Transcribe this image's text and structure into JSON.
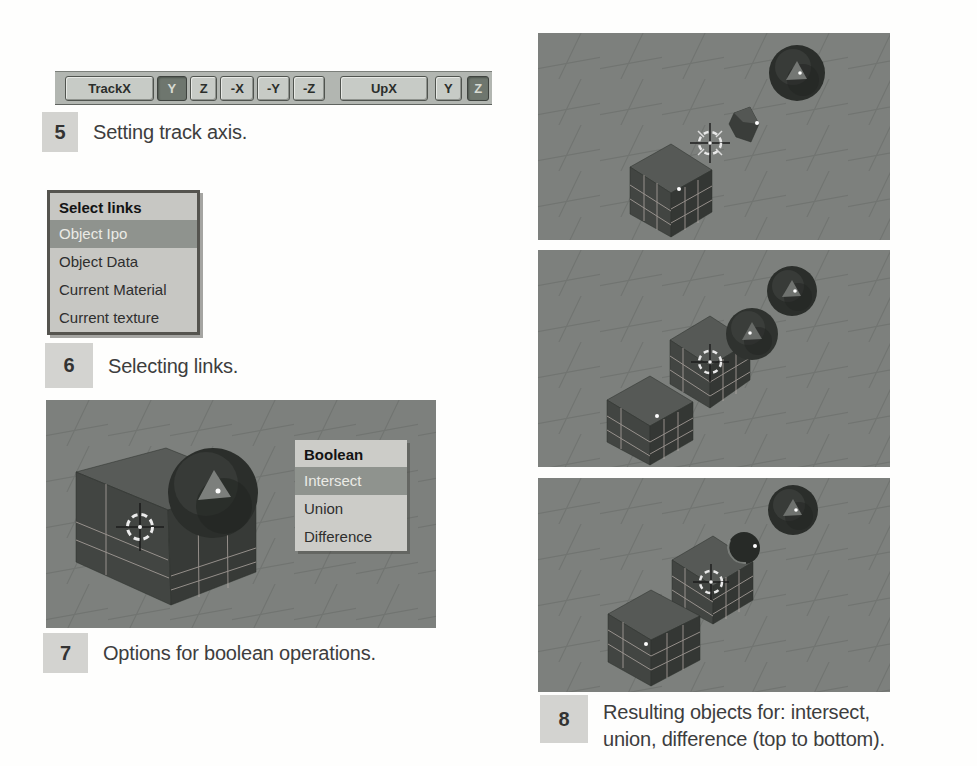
{
  "figures": {
    "fig5": {
      "number": "5",
      "caption": "Setting track axis.",
      "toolbar": {
        "buttons": [
          {
            "label": "TrackX",
            "pressed": false
          },
          {
            "label": "Y",
            "pressed": true
          },
          {
            "label": "Z",
            "pressed": false
          },
          {
            "label": "-X",
            "pressed": false
          },
          {
            "label": "-Y",
            "pressed": false
          },
          {
            "label": "-Z",
            "pressed": false
          },
          {
            "label": "UpX",
            "pressed": false
          },
          {
            "label": "Y",
            "pressed": false
          },
          {
            "label": "Z",
            "pressed": true
          }
        ]
      }
    },
    "fig6": {
      "number": "6",
      "caption": "Selecting links.",
      "menu": {
        "title": "Select links",
        "items": [
          {
            "label": "Object Ipo",
            "highlighted": true
          },
          {
            "label": "Object Data",
            "highlighted": false
          },
          {
            "label": "Current Material",
            "highlighted": false
          },
          {
            "label": "Current texture",
            "highlighted": false
          }
        ]
      }
    },
    "fig7": {
      "number": "7",
      "caption": "Options for boolean operations.",
      "menu": {
        "title": "Boolean",
        "items": [
          {
            "label": "Intersect",
            "highlighted": true
          },
          {
            "label": "Union",
            "highlighted": false
          },
          {
            "label": "Difference",
            "highlighted": false
          }
        ]
      }
    },
    "fig8": {
      "number": "8",
      "caption_line1": "Resulting objects for: intersect,",
      "caption_line2": "union, difference (top to bottom).",
      "scenes": [
        "intersect-result",
        "union-result",
        "difference-result"
      ]
    }
  },
  "colors": {
    "viewport_bg": "#7d807d",
    "grid_line": "#6e716e",
    "object_dark": "#373a37",
    "object_top": "#575a57",
    "wireframe": "#b4aba6",
    "menu_bg": "#c7c7c3",
    "menu_highlight": "#8f938e",
    "toolbar_bg": "#b2b6b1",
    "button_face": "#c7cbc6",
    "button_pressed": "#6e766e",
    "caption_box": "#d3d3d0",
    "caption_text": "#3d3d3d"
  }
}
